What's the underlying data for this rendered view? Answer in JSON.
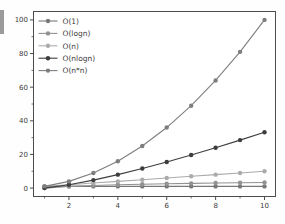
{
  "page": {
    "background": "#fefefe",
    "width": 285,
    "height": 224
  },
  "artifact": {
    "label": "cropped-ui-fragment",
    "color": "#9b9b9b"
  },
  "chart_data": {
    "type": "line",
    "title": "",
    "xlabel": "",
    "ylabel": "",
    "x": [
      1,
      2,
      3,
      4,
      5,
      6,
      7,
      8,
      9,
      10
    ],
    "series": [
      {
        "name": "O(1)",
        "color": "#787878",
        "values": [
          1,
          1,
          1,
          1,
          1,
          1,
          1,
          1,
          1,
          1
        ]
      },
      {
        "name": "O(logn)",
        "color": "#929292",
        "values": [
          0,
          1,
          1.58,
          2,
          2.32,
          2.58,
          2.81,
          3,
          3.17,
          3.32
        ]
      },
      {
        "name": "O(n)",
        "color": "#ababab",
        "values": [
          1,
          2,
          3,
          4,
          5,
          6,
          7,
          8,
          9,
          10
        ]
      },
      {
        "name": "O(nlogn)",
        "color": "#3d3d3d",
        "values": [
          0,
          2,
          4.75,
          8,
          11.61,
          15.51,
          19.65,
          24,
          28.53,
          33.22
        ]
      },
      {
        "name": "O(n*n)",
        "color": "#7e7e7e",
        "values": [
          1,
          4,
          9,
          16,
          25,
          36,
          49,
          64,
          81,
          100
        ]
      }
    ],
    "legend_entries": [
      "O(1)",
      "O(logn)",
      "O(n)",
      "O(nlogn)",
      "O(n*n)"
    ],
    "legend_position": "upper-left",
    "xlim": [
      0.55,
      10.45
    ],
    "ylim": [
      -5,
      105
    ],
    "x_major_ticks": [
      2,
      4,
      6,
      8,
      10
    ],
    "x_minor_ticks": [
      1,
      3,
      5,
      7,
      9
    ],
    "y_major_ticks": [
      0,
      20,
      40,
      60,
      80,
      100
    ],
    "y_minor_ticks": [
      10,
      30,
      50,
      70,
      90
    ],
    "x_tick_labels": [
      "2",
      "4",
      "6",
      "8",
      "10"
    ],
    "y_tick_labels": [
      "0",
      "20",
      "40",
      "60",
      "80",
      "100"
    ],
    "grid": false,
    "axis_color": "#4c4c4c",
    "text_color": "#3c3c3c",
    "plot_background": "#ffffff"
  }
}
